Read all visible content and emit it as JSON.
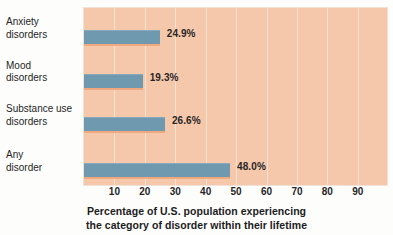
{
  "chart_data": {
    "type": "bar",
    "orientation": "horizontal",
    "title": "",
    "subtitle": "",
    "xlabel": "Percentage of U.S. population experiencing the category of disorder within their lifetime",
    "ylabel": "",
    "categories": [
      "Anxiety\ndisorders",
      "Mood\ndisorders",
      "Substance use\ndisorders",
      "Any\ndisorder"
    ],
    "values": [
      24.9,
      19.3,
      26.6,
      48.0
    ],
    "value_labels": [
      "24.9%",
      "19.3%",
      "26.6%",
      "48.0%"
    ],
    "xlim": [
      0,
      99.6
    ],
    "xticks": [
      10,
      20,
      30,
      40,
      50,
      60,
      70,
      80,
      90
    ],
    "xtick_labels": [
      "10",
      "20",
      "30",
      "40",
      "50",
      "60",
      "70",
      "80",
      "90"
    ],
    "grid": true,
    "grid_axis": "x",
    "legend": false,
    "colors": {
      "bar": "#6e99af",
      "bar_top_edge": "#87a9bb",
      "bar_bottom_edge": "#f0a87e",
      "plot_background": "#f6c8ab",
      "gridline": "#fae3d2",
      "figure_background": "#fdfdfc",
      "text": "#262626"
    }
  },
  "caption": {
    "line1": "Percentage of U.S. population experiencing",
    "line2": "the category of disorder within their lifetime"
  }
}
